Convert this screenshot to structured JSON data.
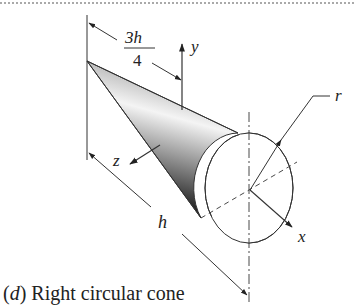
{
  "figure": {
    "caption_prefix": "(",
    "caption_letter": "d",
    "caption_suffix": ") Right circular cone",
    "labels": {
      "dimension_numerator": "3h",
      "dimension_denominator": "4",
      "y_axis": "y",
      "z_axis": "z",
      "x_axis": "x",
      "radius": "r",
      "height": "h"
    },
    "colors": {
      "line": "#333333",
      "shade_dark": "#1a1a1a",
      "shade_light": "#f2f2f2"
    }
  }
}
